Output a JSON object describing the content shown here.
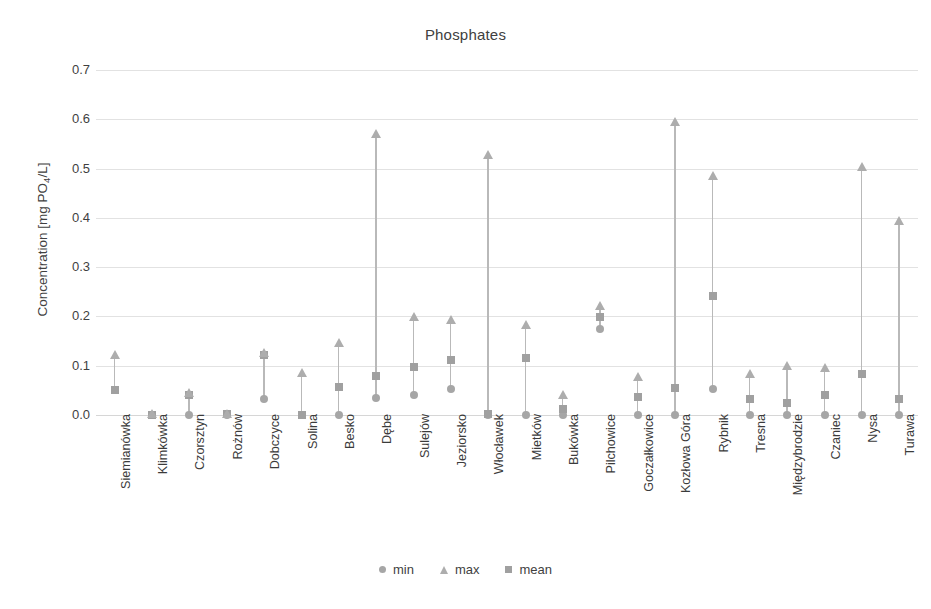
{
  "chart_data": {
    "type": "scatter",
    "title": "Phosphates",
    "xlabel": "",
    "ylabel": "Concentration [mg PO4/L]",
    "ylabel_prefix": "Concentration [mg PO",
    "ylabel_sub": "4",
    "ylabel_suffix": "/L]",
    "ylim": [
      0.0,
      0.7
    ],
    "ytick_labels": [
      "0.7",
      "0.6",
      "0.5",
      "0.4",
      "0.3",
      "0.2",
      "0.1",
      "0.0"
    ],
    "ytick_values": [
      0.7,
      0.6,
      0.5,
      0.4,
      0.3,
      0.2,
      0.1,
      0.0
    ],
    "grid": true,
    "legend_position": "bottom",
    "legend": [
      {
        "label": "min",
        "marker": "circle",
        "color": "#a6a6a6"
      },
      {
        "label": "max",
        "marker": "triangle",
        "color": "#adadad"
      },
      {
        "label": "mean",
        "marker": "square",
        "color": "#a0a0a0"
      }
    ],
    "categories": [
      "Siemianówka",
      "Klimkówka",
      "Czorsztyn",
      "Rożnów",
      "Dobczyce",
      "Solina",
      "Besko",
      "Dębe",
      "Sulejów",
      "Jeziorsko",
      "Włocławek",
      "Mietków",
      "Bukówka",
      "Pilchowice",
      "Goczałkowice",
      "Kozłowa Góra",
      "Rybnik",
      "Tresna",
      "Międzybrodzie",
      "Czaniec",
      "Nysa",
      "Turawa"
    ],
    "series": [
      {
        "name": "min",
        "values": [
          0.05,
          0.0,
          0.0,
          0.0,
          0.033,
          0.0,
          0.0,
          0.035,
          0.04,
          0.053,
          0.0,
          0.0,
          0.0,
          0.175,
          0.0,
          0.0,
          0.052,
          0.0,
          0.0,
          0.0,
          0.0,
          0.0
        ]
      },
      {
        "name": "max",
        "values": [
          0.122,
          0.002,
          0.045,
          0.003,
          0.125,
          0.085,
          0.147,
          0.57,
          0.198,
          0.193,
          0.527,
          0.183,
          0.04,
          0.222,
          0.077,
          0.595,
          0.485,
          0.083,
          0.1,
          0.095,
          0.503,
          0.393
        ]
      },
      {
        "name": "mean",
        "values": [
          0.05,
          0.001,
          0.04,
          0.002,
          0.122,
          0.001,
          0.057,
          0.08,
          0.098,
          0.112,
          0.002,
          0.116,
          0.013,
          0.198,
          0.036,
          0.055,
          0.242,
          0.033,
          0.025,
          0.04,
          0.083,
          0.033
        ]
      }
    ]
  }
}
